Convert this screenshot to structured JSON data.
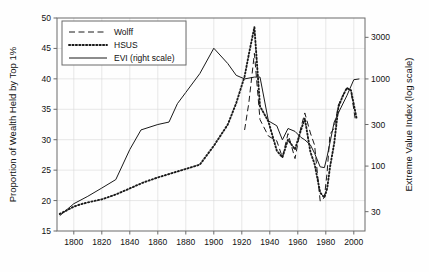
{
  "figure": {
    "background_color": "#fefefe",
    "frame_color": "#6b6b6b",
    "grid_color": "#d9d9d9",
    "series_color": "#1a1a1a"
  },
  "chart_data": {
    "type": "line",
    "title": "",
    "subtitle": "",
    "xlabel": "",
    "ylabel": "Proportion of Wealth Held by Top 1%",
    "y2label": "Extreme Value Index (log scale)",
    "xlim": [
      1788,
      2008
    ],
    "ylim": [
      15,
      50
    ],
    "y2lim": [
      18,
      5000
    ],
    "y2_scale": "log",
    "grid": true,
    "legend_position": "top-left",
    "xticks": [
      1800,
      1820,
      1840,
      1860,
      1880,
      1900,
      1920,
      1940,
      1960,
      1980,
      2000
    ],
    "xticklabels": [
      "1800",
      "1820",
      "1840",
      "1860",
      "1880",
      "1900",
      "1920",
      "1940",
      "1960",
      "1980",
      "2000"
    ],
    "yticks": [
      15,
      20,
      25,
      30,
      35,
      40,
      45,
      50
    ],
    "yticklabels": [
      "15",
      "20",
      "25",
      "30",
      "35",
      "40",
      "45",
      "50"
    ],
    "y2ticks": [
      30,
      100,
      300,
      1000,
      3000
    ],
    "y2ticklabels": [
      "30",
      "100",
      "300",
      "1000",
      "3000"
    ],
    "legend": [
      {
        "label": "Wolff",
        "style": "dashed",
        "axis": "left"
      },
      {
        "label": "HSUS",
        "style": "dotted",
        "axis": "left"
      },
      {
        "label": "EVI (right scale)",
        "style": "solid",
        "axis": "right"
      }
    ],
    "series": [
      {
        "name": "Wolff",
        "style": "dashed",
        "axis": "left",
        "x": [
          1922,
          1925,
          1929,
          1933,
          1939,
          1945,
          1949,
          1953,
          1958,
          1962,
          1965,
          1969,
          1972,
          1976,
          1979,
          1981,
          1983,
          1986,
          1989,
          1992,
          1995,
          1998,
          2001
        ],
        "values": [
          31.6,
          36.0,
          44.2,
          33.3,
          30.6,
          29.8,
          27.1,
          31.0,
          26.9,
          31.8,
          34.4,
          31.1,
          29.1,
          19.9,
          20.5,
          24.8,
          30.9,
          31.9,
          35.7,
          37.2,
          38.5,
          38.1,
          33.4
        ]
      },
      {
        "name": "HSUS",
        "style": "dotted",
        "axis": "left",
        "x": [
          1790,
          1795,
          1800,
          1805,
          1810,
          1820,
          1830,
          1840,
          1850,
          1860,
          1870,
          1880,
          1890,
          1900,
          1910,
          1916,
          1922,
          1925,
          1929,
          1933,
          1939,
          1945,
          1949,
          1953,
          1958,
          1962,
          1965,
          1969,
          1972,
          1976,
          1979,
          1981,
          1983,
          1986,
          1989,
          1992,
          1995,
          1998,
          2002
        ],
        "values": [
          17.8,
          18.4,
          19.0,
          19.4,
          19.7,
          20.2,
          21.0,
          22.0,
          23.0,
          23.8,
          24.5,
          25.2,
          25.9,
          29.0,
          32.5,
          36.0,
          40.4,
          44.0,
          48.5,
          35.5,
          33.0,
          28.2,
          27.1,
          30.0,
          28.4,
          31.4,
          33.5,
          28.0,
          26.0,
          21.3,
          20.5,
          22.0,
          25.5,
          29.4,
          35.4,
          37.1,
          38.5,
          38.1,
          33.5
        ]
      },
      {
        "name": "EVI (right scale)",
        "style": "solid",
        "axis": "right",
        "x": [
          1790,
          1800,
          1810,
          1820,
          1830,
          1840,
          1848,
          1860,
          1868,
          1874,
          1880,
          1890,
          1900,
          1910,
          1916,
          1922,
          1929,
          1933,
          1939,
          1945,
          1949,
          1953,
          1958,
          1962,
          1965,
          1969,
          1972,
          1976,
          1979,
          1981,
          1986,
          1990,
          1995,
          2000,
          2004
        ],
        "values": [
          27,
          37,
          45,
          56,
          70,
          155,
          260,
          300,
          320,
          520,
          700,
          1150,
          2250,
          1500,
          1100,
          1000,
          1050,
          1050,
          330,
          290,
          200,
          270,
          250,
          215,
          200,
          175,
          140,
          98,
          96,
          130,
          320,
          440,
          640,
          980,
          1000
        ]
      }
    ]
  }
}
